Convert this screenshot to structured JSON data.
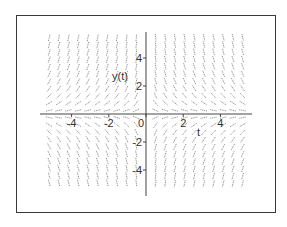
{
  "chart_data": {
    "type": "direction_field",
    "title": "",
    "xlabel": "t",
    "ylabel": "y(t)",
    "xlim": [
      -5.5,
      5.5
    ],
    "ylim": [
      -5.5,
      5.5
    ],
    "x_ticks": [
      -4,
      -2,
      0,
      2,
      4
    ],
    "y_ticks": [
      -4,
      -2,
      2,
      4
    ],
    "x_tick_labels": [
      "-4",
      "-2",
      "0",
      "2",
      "4"
    ],
    "y_tick_labels": [
      "4",
      "2",
      "-2",
      "-4"
    ],
    "grid": false,
    "legend": null,
    "field_description": "Slope field: positive slopes in quadrants II and IV, negative slopes in quadrants I and III; slopes flatten near y = 0 and steepen as |y| grows",
    "grid_t_step": 0.55,
    "grid_y_step": 0.55,
    "color": "#555555"
  },
  "labels": {
    "x_axis": "t",
    "y_axis": "y(t)",
    "origin": "0"
  }
}
